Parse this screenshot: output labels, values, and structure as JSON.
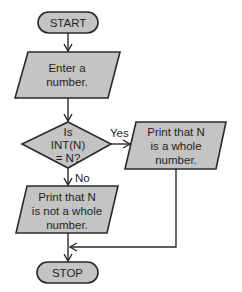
{
  "flowchart": {
    "start": {
      "label": "START",
      "shape": "terminator"
    },
    "input": {
      "lines": [
        "Enter a",
        "number."
      ],
      "shape": "parallelogram"
    },
    "decision": {
      "lines": [
        "Is",
        "INT(N)",
        "= N?"
      ],
      "shape": "diamond"
    },
    "yes_branch": {
      "edge_label": "Yes",
      "lines": [
        "Print that N",
        "is a whole",
        "number."
      ],
      "shape": "parallelogram"
    },
    "no_branch": {
      "edge_label": "No",
      "lines": [
        "Print that N",
        "is not a whole",
        "number."
      ],
      "shape": "parallelogram"
    },
    "stop": {
      "label": "STOP",
      "shape": "terminator"
    },
    "colors": {
      "fill": "#c4c4c4",
      "stroke": "#2a2a2a",
      "background": "#ffffff"
    }
  }
}
